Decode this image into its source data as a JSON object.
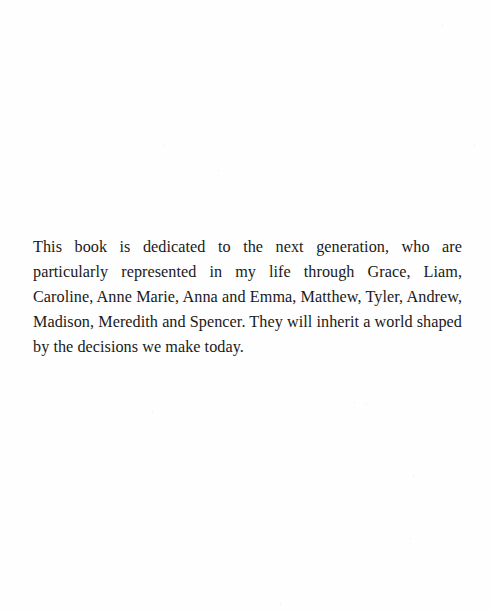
{
  "page": {
    "type": "dedication",
    "background_color": "#ffffff",
    "text_color": "#1a1a1a"
  },
  "dedication": {
    "text": "This book is dedicated to the next generation, who are particularly represented in my life through Grace, Liam, Caroline, Anne Marie, Anna and Emma, Matthew, Tyler, Andrew, Madison, Meredith and Spencer. They will inherit a world shaped by the decisions we make today."
  }
}
